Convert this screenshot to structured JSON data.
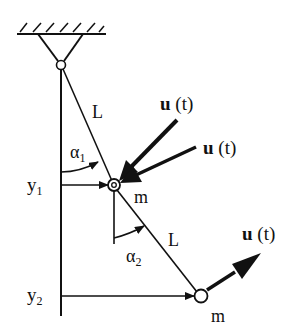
{
  "diagram": {
    "type": "double-pendulum",
    "labels": {
      "link1_length": "L",
      "link2_length": "L",
      "mass1": "m",
      "mass2": "m",
      "angle1": "α",
      "angle1_sub": "1",
      "angle2": "α",
      "angle2_sub": "2",
      "pos1": "y",
      "pos1_sub": "1",
      "pos2": "y",
      "pos2_sub": "2",
      "force_bold": "u",
      "force_arg": " (t)"
    },
    "forces": [
      {
        "id": "u1",
        "label_bold": "u",
        "label_arg": " (t)",
        "target": "mass1"
      },
      {
        "id": "u2",
        "label_bold": "u",
        "label_arg": " (t)",
        "target": "mass1"
      },
      {
        "id": "u3",
        "label_bold": "u",
        "label_arg": " (t)",
        "target": "mass2"
      }
    ],
    "colors": {
      "stroke": "#111111",
      "background": "#ffffff"
    }
  }
}
